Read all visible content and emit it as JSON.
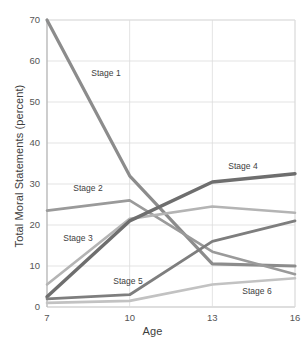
{
  "chart_data": {
    "type": "line",
    "title": "",
    "xlabel": "Age",
    "ylabel": "Total Moral Statements (percent)",
    "x": [
      7,
      10,
      13,
      16
    ],
    "xtick_labels": [
      "7",
      "10",
      "13",
      "16"
    ],
    "ytick_labels": [
      "0",
      "10",
      "20",
      "30",
      "40",
      "50",
      "60",
      "70"
    ],
    "yticks": [
      0,
      10,
      20,
      30,
      40,
      50,
      60,
      70
    ],
    "xlim": [
      7,
      16
    ],
    "ylim": [
      0,
      70
    ],
    "grid": true,
    "legend_position": "inline-labels",
    "series": [
      {
        "name": "Stage 1",
        "values": [
          70,
          32,
          10.5,
          10
        ],
        "color": "#8c8c8c",
        "width": 3.2,
        "label_x": 106,
        "label_y": 76
      },
      {
        "name": "Stage 2",
        "values": [
          23.5,
          26,
          13.5,
          8
        ],
        "color": "#9a9a9a",
        "width": 2.6,
        "label_x": 88,
        "label_y": 191
      },
      {
        "name": "Stage 3",
        "values": [
          5.5,
          21.5,
          24.5,
          23
        ],
        "color": "#b4b4b4",
        "width": 2.6,
        "label_x": 78,
        "label_y": 241
      },
      {
        "name": "Stage 4",
        "values": [
          2.5,
          21,
          30.5,
          32.5
        ],
        "color": "#6e6e6e",
        "width": 3.4,
        "label_x": 243,
        "label_y": 169
      },
      {
        "name": "Stage 5",
        "values": [
          2,
          3,
          16,
          21
        ],
        "color": "#7e7e7e",
        "width": 2.8,
        "label_x": 128,
        "label_y": 284
      },
      {
        "name": "Stage 6",
        "values": [
          1,
          1.5,
          5.5,
          7
        ],
        "color": "#c2c2c2",
        "width": 2.6,
        "label_x": 257,
        "label_y": 294
      }
    ]
  },
  "axes": {
    "x_title": "Age",
    "y_title": "Total Moral Statements (percent)"
  }
}
